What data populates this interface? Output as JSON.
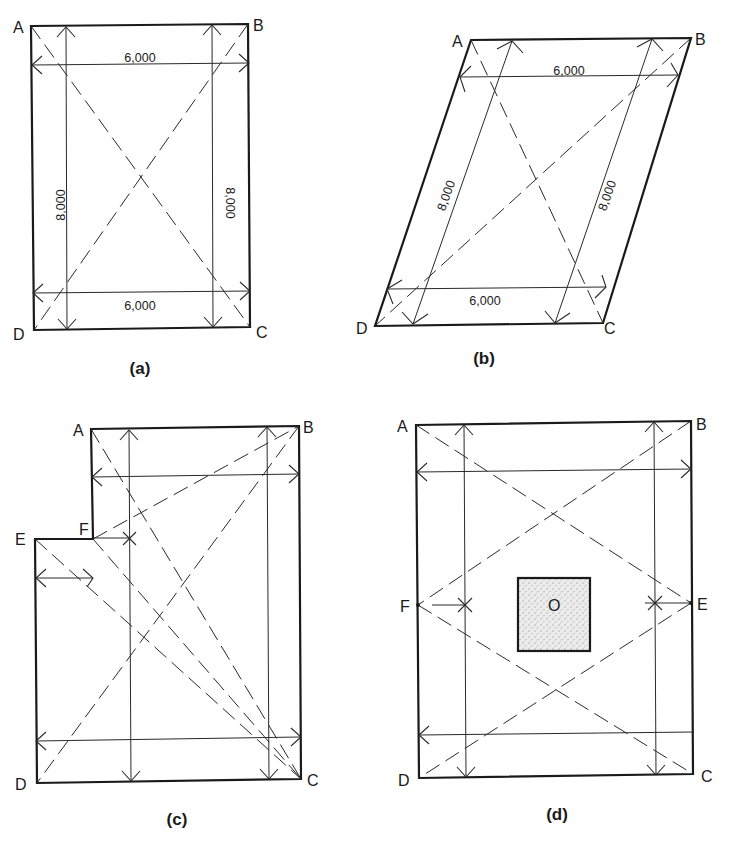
{
  "figures": {
    "a": {
      "caption": "(a)",
      "vertices": {
        "A": "A",
        "B": "B",
        "C": "C",
        "D": "D"
      },
      "dimensions": {
        "top_width": "6,000",
        "bottom_width": "6,000",
        "left_height": "8,000",
        "right_height": "8,000"
      }
    },
    "b": {
      "caption": "(b)",
      "vertices": {
        "A": "A",
        "B": "B",
        "C": "C",
        "D": "D"
      },
      "dimensions": {
        "top_width": "6,000",
        "bottom_width": "6,000",
        "left_height": "8,000",
        "right_height": "8,000"
      }
    },
    "c": {
      "caption": "(c)",
      "vertices": {
        "A": "A",
        "B": "B",
        "C": "C",
        "D": "D",
        "E": "E",
        "F": "F"
      }
    },
    "d": {
      "caption": "(d)",
      "vertices": {
        "A": "A",
        "B": "B",
        "C": "C",
        "D": "D",
        "E": "E",
        "F": "F"
      },
      "center_label": "O"
    }
  },
  "colors": {
    "ink": "#1a1a1a",
    "paper": "#ffffff",
    "stipple": "#e4e4e4"
  }
}
